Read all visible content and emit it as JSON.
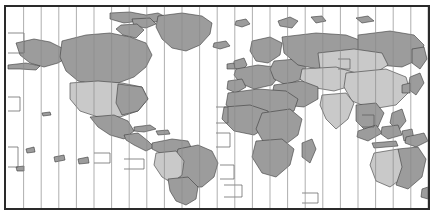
{
  "map": {
    "title": "World Time Zone Map",
    "projection": "equirectangular",
    "frame": {
      "border_color": "#2a2a2a",
      "border_width_px": 2,
      "background_color": "#ffffff",
      "x": 4,
      "y": 5,
      "width": 426,
      "height": 205
    },
    "colors": {
      "land_dark": "#9c9c9c",
      "land_light": "#c9c9c9",
      "land_mid": "#b0b0b0",
      "ocean": "#ffffff",
      "country_border": "#3a3a3a",
      "meridian_line": "#8d8d8d",
      "frame_border": "#2a2a2a"
    },
    "meridians": {
      "label": "hour meridian lines",
      "count": 24,
      "spacing_px": 17.6,
      "color": "#8d8d8d",
      "width_px": 1
    },
    "legend": {
      "shading_note": "alternating light and dark bands mark adjacent time zones"
    },
    "timezone_offsets": [
      "-12",
      "-11",
      "-10",
      "-9",
      "-8",
      "-7",
      "-6",
      "-5",
      "-4",
      "-3",
      "-2",
      "-1",
      "0",
      "+1",
      "+2",
      "+3",
      "+4",
      "+5",
      "+6",
      "+7",
      "+8",
      "+9",
      "+10",
      "+11",
      "+12"
    ],
    "regions": [
      {
        "name": "Greenland",
        "shade": "dark"
      },
      {
        "name": "Alaska",
        "shade": "dark"
      },
      {
        "name": "Canada",
        "shade": "dark"
      },
      {
        "name": "United States",
        "shade": "light"
      },
      {
        "name": "Mexico",
        "shade": "dark"
      },
      {
        "name": "Central America",
        "shade": "dark"
      },
      {
        "name": "Caribbean",
        "shade": "dark"
      },
      {
        "name": "Brazil",
        "shade": "dark"
      },
      {
        "name": "Argentina",
        "shade": "dark"
      },
      {
        "name": "Chile",
        "shade": "dark"
      },
      {
        "name": "Peru",
        "shade": "light"
      },
      {
        "name": "Bolivia",
        "shade": "light"
      },
      {
        "name": "Colombia",
        "shade": "dark"
      },
      {
        "name": "Iceland",
        "shade": "dark"
      },
      {
        "name": "United Kingdom",
        "shade": "dark"
      },
      {
        "name": "Scandinavia",
        "shade": "dark"
      },
      {
        "name": "Western Europe",
        "shade": "dark"
      },
      {
        "name": "Eastern Europe",
        "shade": "dark"
      },
      {
        "name": "Russia",
        "shade": "dark"
      },
      {
        "name": "Siberia",
        "shade": "light"
      },
      {
        "name": "Kazakhstan",
        "shade": "light"
      },
      {
        "name": "China",
        "shade": "light"
      },
      {
        "name": "Mongolia",
        "shade": "light"
      },
      {
        "name": "India",
        "shade": "light"
      },
      {
        "name": "Middle East",
        "shade": "dark"
      },
      {
        "name": "North Africa",
        "shade": "dark"
      },
      {
        "name": "Sub-Saharan Africa",
        "shade": "dark"
      },
      {
        "name": "Southern Africa",
        "shade": "dark"
      },
      {
        "name": "Madagascar",
        "shade": "dark"
      },
      {
        "name": "Southeast Asia",
        "shade": "dark"
      },
      {
        "name": "Indonesia",
        "shade": "dark"
      },
      {
        "name": "Philippines",
        "shade": "dark"
      },
      {
        "name": "Japan",
        "shade": "dark"
      },
      {
        "name": "Papua New Guinea",
        "shade": "dark"
      },
      {
        "name": "Western Australia",
        "shade": "light"
      },
      {
        "name": "Eastern Australia",
        "shade": "dark"
      },
      {
        "name": "New Zealand",
        "shade": "dark"
      }
    ]
  }
}
